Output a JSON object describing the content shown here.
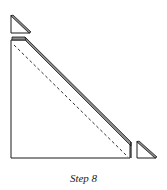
{
  "caption": "Step 8",
  "colors": {
    "stroke": "#1a1a1a",
    "band": "#8c8c8c",
    "background": "#ffffff"
  }
}
